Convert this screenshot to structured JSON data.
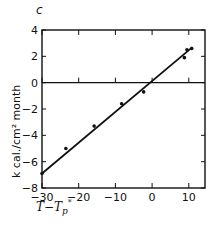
{
  "chart_data": {
    "type": "scatter",
    "panel_label": "c",
    "title": "",
    "xlabel": "T - T_p*",
    "ylabel": "k cal./cm² month",
    "xlim": [
      -30,
      14
    ],
    "ylim": [
      -8,
      4
    ],
    "x_ticks": [
      -30,
      -20,
      -10,
      0,
      10
    ],
    "x_tick_labels": [
      "−30",
      "−20",
      "−10",
      "0",
      "10"
    ],
    "y_ticks": [
      4,
      2,
      0,
      -2,
      -4,
      -6,
      -8
    ],
    "y_tick_labels": [
      "4",
      "2",
      "0",
      "−2",
      "−4",
      "−6",
      "−8"
    ],
    "grid": false,
    "zero_line": true,
    "series": [
      {
        "name": "observations",
        "kind": "points",
        "x": [
          -30,
          -23.5,
          -15.8,
          -8.3,
          -2.3,
          8.8,
          9.5,
          10.8
        ],
        "y": [
          -6.9,
          -5.0,
          -3.3,
          -1.6,
          -0.7,
          1.9,
          2.5,
          2.6
        ]
      },
      {
        "name": "fit",
        "kind": "line",
        "x": [
          -30,
          11
        ],
        "y": [
          -6.9,
          2.7
        ]
      }
    ]
  }
}
